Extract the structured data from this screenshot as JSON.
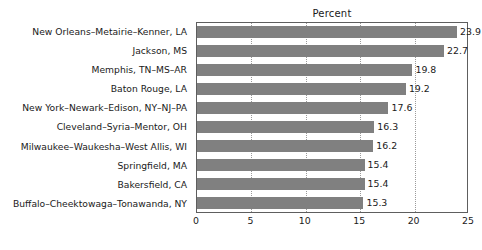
{
  "chart_data": {
    "type": "bar",
    "orientation": "horizontal",
    "title": "Percent",
    "xlabel": "",
    "ylabel": "",
    "xlim": [
      0,
      25
    ],
    "xticks": [
      0,
      5,
      10,
      15,
      20,
      25
    ],
    "xtick_labels": [
      "0",
      "5",
      "10",
      "15",
      "20",
      "25"
    ],
    "grid": "vertical-dotted",
    "legend": "none",
    "bar_color": "#808080",
    "categories": [
      "New Orleans–Metairie–Kenner, LA",
      "Jackson, MS",
      "Memphis, TN–MS–AR",
      "Baton Rouge, LA",
      "New York–Newark–Edison, NY–NJ–PA",
      "Cleveland–Syria–Mentor, OH",
      "Milwaukee–Waukesha–West Allis, WI",
      "Springfield, MA",
      "Bakersfield, CA",
      "Buffalo–Cheektowaga–Tonawanda, NY"
    ],
    "values": [
      23.9,
      22.7,
      19.8,
      19.2,
      17.6,
      16.3,
      16.2,
      15.4,
      15.4,
      15.3
    ],
    "value_labels": [
      "23.9",
      "22.7",
      "19.8",
      "19.2",
      "17.6",
      "16.3",
      "16.2",
      "15.4",
      "15.4",
      "15.3"
    ]
  }
}
